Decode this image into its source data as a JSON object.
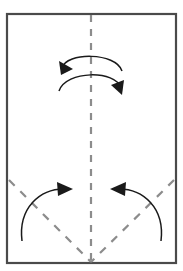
{
  "figure": {
    "type": "origami-fold-diagram",
    "title": "Origami fold step diagram",
    "canvas": {
      "width": 183,
      "height": 271,
      "background": "#ffffff"
    }
  },
  "colors": {
    "background": "#ffffff",
    "paper_fill": "#ffffff",
    "paper_border": "#4a4a4a",
    "fold_line": "#8c8c8c",
    "arrow": "#1a1a1a"
  },
  "paper": {
    "label": "paper-sheet",
    "x": 7,
    "y": 14,
    "width": 169,
    "height": 249,
    "border_width": 2.2
  },
  "fold_lines": [
    {
      "name": "vertical-center-fold",
      "kind": "dashed",
      "orientation": "vertical",
      "x1": 91,
      "y1": 15,
      "x2": 91,
      "y2": 262,
      "dash": "7 7",
      "width": 2.2
    },
    {
      "name": "left-diagonal-fold",
      "kind": "dashed",
      "orientation": "diagonal",
      "x1": 9,
      "y1": 180,
      "x2": 91,
      "y2": 262,
      "dash": "8 8",
      "width": 2.2
    },
    {
      "name": "right-diagonal-fold",
      "kind": "dashed",
      "orientation": "diagonal",
      "x1": 174,
      "y1": 180,
      "x2": 91,
      "y2": 262,
      "dash": "8 8",
      "width": 2.2
    }
  ],
  "arrows": [
    {
      "name": "top-outer-arrow",
      "direction": "leftward",
      "description": "Outer arc above center pointing to the left",
      "path": "M 62 68 C 66 52 116 52 122 71",
      "head": "59,61 73,69 61,75",
      "width": 1.5
    },
    {
      "name": "top-inner-arrow",
      "direction": "rightward",
      "description": "Inner arc below the outer one pointing to the right",
      "path": "M 59 91 C 66 70 116 70 121 88",
      "head": "124,80 122,95 111,85",
      "width": 1.5
    },
    {
      "name": "bottom-left-arrow",
      "direction": "rightward-inward",
      "description": "Lower-left arc sweeping inward toward center",
      "path": "M 22 241 C 18 208 40 188 66 189",
      "head": "57,182 73,189 58,196",
      "width": 1.5
    },
    {
      "name": "bottom-right-arrow",
      "direction": "leftward-inward",
      "description": "Lower-right arc sweeping inward toward center",
      "path": "M 161 241 C 165 208 143 188 117 189",
      "head": "126,182 110,189 125,196",
      "width": 1.5
    }
  ]
}
